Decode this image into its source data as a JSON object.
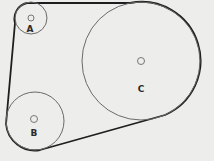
{
  "diagram": {
    "type": "belt-and-pulley",
    "background": "#ededeb",
    "belt_color": "#1e1e1e",
    "pulleys": [
      {
        "label": "A",
        "cx": 31,
        "cy": 18,
        "r": 16,
        "hub_r": 3
      },
      {
        "label": "B",
        "cx": 35,
        "cy": 121,
        "r": 29,
        "hub_r": 3.5
      },
      {
        "label": "C",
        "cx": 141,
        "cy": 61,
        "r": 59,
        "hub_r": 3.5
      }
    ]
  }
}
